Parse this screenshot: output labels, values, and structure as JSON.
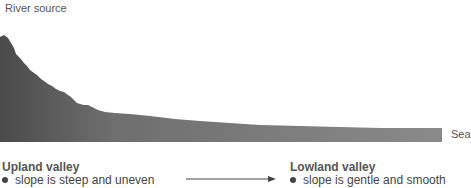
{
  "labels": {
    "source": "River source",
    "sea": "Sea"
  },
  "upland": {
    "heading": "Upland valley",
    "bullet": "slope is steep and uneven"
  },
  "lowland": {
    "heading": "Lowland valley",
    "bullet": "slope is gentle and smooth"
  },
  "colors": {
    "profile_fill": "#7a7a7a",
    "profile_dark": "#4a4a4a",
    "text": "#555555"
  }
}
